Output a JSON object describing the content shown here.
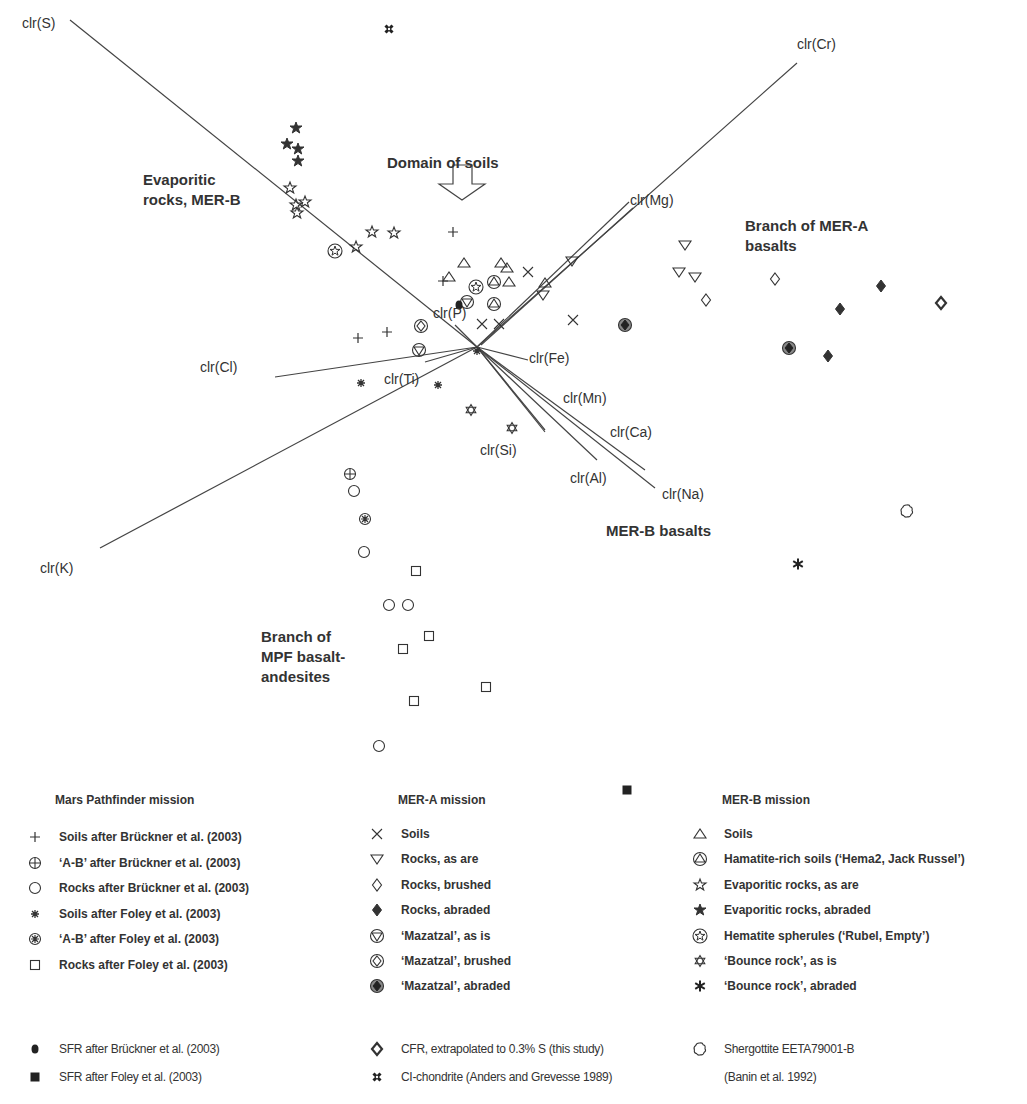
{
  "chart_data": {
    "type": "scatter",
    "subtype": "clr-biplot",
    "title": "",
    "xlabel": "",
    "ylabel": "",
    "grid": false,
    "origin_px": [
      477,
      347
    ],
    "axes_vectors": [
      {
        "label": "clr(S)",
        "end": [
          70,
          20
        ],
        "label_pos": [
          22,
          28
        ]
      },
      {
        "label": "clr(Cr)",
        "end": [
          797,
          63
        ],
        "label_pos": [
          797,
          49
        ]
      },
      {
        "label": "clr(Mg)",
        "end": [
          629,
          202
        ],
        "label_pos": [
          630,
          205
        ]
      },
      {
        "label": "clr(P)",
        "end": [
          455,
          325
        ],
        "label_pos": [
          433,
          318
        ]
      },
      {
        "label": "clr(Cl)",
        "end": [
          275,
          377
        ],
        "label_pos": [
          200,
          372
        ]
      },
      {
        "label": "clr(Ti)",
        "end": [
          425,
          362
        ],
        "label_pos": [
          384,
          384
        ]
      },
      {
        "label": "clr(K)",
        "end": [
          100,
          548
        ],
        "label_pos": [
          40,
          573
        ]
      },
      {
        "label": "clr(Fe)",
        "end": [
          528,
          360
        ],
        "label_pos": [
          529,
          363
        ]
      },
      {
        "label": "clr(Mn)",
        "end": [
          545,
          430
        ],
        "label_pos": [
          563,
          403
        ]
      },
      {
        "label": "clr(Si)",
        "end": [
          545,
          432
        ],
        "label_pos": [
          480,
          455
        ]
      },
      {
        "label": "clr(Al)",
        "end": [
          597,
          460
        ],
        "label_pos": [
          570,
          483
        ]
      },
      {
        "label": "clr(Ca)",
        "end": [
          645,
          470
        ],
        "label_pos": [
          610,
          437
        ]
      },
      {
        "label": "clr(Na)",
        "end": [
          655,
          488
        ],
        "label_pos": [
          662,
          499
        ]
      }
    ],
    "annotations": [
      {
        "text": "Domain of soils",
        "pos": [
          388,
          167
        ],
        "arrow": "down"
      },
      {
        "text": "Evaporitic rocks, MER-B",
        "pos": [
          143,
          184
        ]
      },
      {
        "text": "Branch of MER-A basalts",
        "pos": [
          745,
          230
        ]
      },
      {
        "text": "MER-B basalts",
        "pos": [
          606,
          535
        ]
      },
      {
        "text": "Branch of MPF basalt-andesites",
        "pos": [
          260,
          641
        ]
      }
    ],
    "series": [
      {
        "name": "MPF Soils after Brückner et al. (2003)",
        "marker": "plus",
        "points": [
          [
            453,
            232
          ],
          [
            443,
            281
          ],
          [
            358,
            338
          ],
          [
            387,
            332
          ]
        ]
      },
      {
        "name": "MPF 'A-B' after Brückner et al. (2003)",
        "marker": "circle-plus",
        "points": [
          [
            350,
            474
          ]
        ]
      },
      {
        "name": "MPF Rocks after Brückner et al. (2003)",
        "marker": "circle",
        "points": [
          [
            354,
            491
          ],
          [
            364,
            552
          ],
          [
            389,
            605
          ],
          [
            408,
            605
          ],
          [
            379,
            746
          ]
        ]
      },
      {
        "name": "MPF Soils after Foley et al. (2003)",
        "marker": "asterisk",
        "points": [
          [
            361,
            383
          ],
          [
            438,
            385
          ],
          [
            477,
            351
          ]
        ]
      },
      {
        "name": "MPF 'A-B' after Foley et al. (2003)",
        "marker": "circle-asterisk",
        "points": [
          [
            365,
            519
          ]
        ]
      },
      {
        "name": "MPF Rocks after Foley et al. (2003)",
        "marker": "square",
        "points": [
          [
            416,
            571
          ],
          [
            429,
            636
          ],
          [
            403,
            649
          ],
          [
            486,
            687
          ],
          [
            414,
            701
          ]
        ]
      },
      {
        "name": "MER-A Soils",
        "marker": "x",
        "points": [
          [
            528,
            272
          ],
          [
            482,
            324
          ],
          [
            499,
            324
          ],
          [
            573,
            320
          ]
        ]
      },
      {
        "name": "MER-A Rocks, as are",
        "marker": "triangle-down",
        "points": [
          [
            572,
            261
          ],
          [
            543,
            295
          ],
          [
            685,
            245
          ],
          [
            679,
            272
          ],
          [
            695,
            277
          ]
        ]
      },
      {
        "name": "MER-A Rocks, brushed",
        "marker": "diamond",
        "points": [
          [
            706,
            300
          ],
          [
            775,
            279
          ]
        ]
      },
      {
        "name": "MER-A Rocks, abraded",
        "marker": "diamond-filled",
        "points": [
          [
            881,
            286
          ],
          [
            840,
            309
          ],
          [
            828,
            356
          ]
        ]
      },
      {
        "name": "MER-A 'Mazatzal', as is",
        "marker": "circle-triangle-down",
        "points": [
          [
            419,
            350
          ],
          [
            467,
            302
          ]
        ]
      },
      {
        "name": "MER-A 'Mazatzal', brushed",
        "marker": "circle-diamond",
        "points": [
          [
            421,
            326
          ]
        ]
      },
      {
        "name": "MER-A 'Mazatzal', abraded",
        "marker": "circle-diamond-filled",
        "points": [
          [
            625,
            325
          ],
          [
            789,
            348
          ]
        ]
      },
      {
        "name": "MER-B Soils",
        "marker": "triangle",
        "points": [
          [
            464,
            263
          ],
          [
            501,
            263
          ],
          [
            449,
            277
          ],
          [
            507,
            268
          ],
          [
            509,
            282
          ],
          [
            545,
            283
          ]
        ]
      },
      {
        "name": "MER-B Hamatite-rich soils ('Hema2, Jack Russel')",
        "marker": "circle-triangle",
        "points": [
          [
            494,
            282
          ],
          [
            494,
            304
          ]
        ]
      },
      {
        "name": "MER-B Evaporitic rocks, as are",
        "marker": "star-open",
        "points": [
          [
            290,
            188
          ],
          [
            305,
            202
          ],
          [
            296,
            205
          ],
          [
            297,
            213
          ],
          [
            356,
            247
          ],
          [
            372,
            232
          ],
          [
            394,
            233
          ]
        ]
      },
      {
        "name": "MER-B Evaporitic rocks, abraded",
        "marker": "star-filled",
        "points": [
          [
            296,
            128
          ],
          [
            287,
            144
          ],
          [
            298,
            149
          ],
          [
            298,
            161
          ]
        ]
      },
      {
        "name": "MER-B Hematite spherules ('Rubel, Empty')",
        "marker": "circle-star",
        "points": [
          [
            335,
            251
          ],
          [
            476,
            287
          ]
        ]
      },
      {
        "name": "MER-B 'Bounce rock', as is",
        "marker": "hexagram",
        "points": [
          [
            471,
            410
          ],
          [
            512,
            428
          ]
        ]
      },
      {
        "name": "MER-B 'Bounce rock', abraded",
        "marker": "asterisk-bold",
        "points": [
          [
            798,
            564
          ]
        ]
      },
      {
        "name": "SFR after Brückner et al. (2003)",
        "marker": "dot-filled",
        "points": [
          [
            459,
            305
          ]
        ]
      },
      {
        "name": "SFR after Foley et al. (2003)",
        "marker": "square-filled",
        "points": [
          [
            627,
            790
          ]
        ]
      },
      {
        "name": "CFR, extrapolated to 0.3% S (this study)",
        "marker": "diamond-bold",
        "points": [
          [
            941,
            303
          ]
        ]
      },
      {
        "name": "CI-chondrite (Anders and Grevesse 1989)",
        "marker": "chondrite-cross",
        "points": [
          [
            389,
            29
          ]
        ]
      },
      {
        "name": "Shergottite EETA79001-B (Banin et al. 1992)",
        "marker": "flower",
        "points": [
          [
            907,
            511
          ]
        ]
      }
    ]
  },
  "labels": {
    "axes": [
      "clr(S)",
      "clr(Cr)",
      "clr(Mg)",
      "clr(P)",
      "clr(Cl)",
      "clr(Ti)",
      "clr(K)",
      "clr(Fe)",
      "clr(Mn)",
      "clr(Si)",
      "clr(Al)",
      "clr(Ca)",
      "clr(Na)"
    ],
    "domain_of_soils": "Domain of soils",
    "evaporitic_1": "Evaporitic",
    "evaporitic_2": "rocks, MER-B",
    "mera_branch_1": "Branch of MER-A",
    "mera_branch_2": "basalts",
    "merb_basalts": "MER-B basalts",
    "mpf_branch_1": "Branch of",
    "mpf_branch_2": "MPF basalt-",
    "mpf_branch_3": "andesites"
  },
  "legend": {
    "mpf": {
      "title": "Mars Pathfinder mission",
      "items": [
        {
          "marker": "plus",
          "label": "Soils after Brückner et al. (2003)"
        },
        {
          "marker": "circle-plus",
          "label": "‘A-B’ after Brückner et al. (2003)"
        },
        {
          "marker": "circle",
          "label": "Rocks after Brückner et al. (2003)"
        },
        {
          "marker": "asterisk",
          "label": "Soils after Foley et al. (2003)"
        },
        {
          "marker": "circle-asterisk",
          "label": "‘A-B’ after Foley et al. (2003)"
        },
        {
          "marker": "square",
          "label": "Rocks after Foley et al. (2003)"
        }
      ]
    },
    "mera": {
      "title": "MER-A mission",
      "items": [
        {
          "marker": "x",
          "label": "Soils"
        },
        {
          "marker": "triangle-down",
          "label": "Rocks, as are"
        },
        {
          "marker": "diamond",
          "label": "Rocks, brushed"
        },
        {
          "marker": "diamond-filled",
          "label": "Rocks, abraded"
        },
        {
          "marker": "circle-triangle-down",
          "label": "‘Mazatzal’, as is"
        },
        {
          "marker": "circle-diamond",
          "label": "‘Mazatzal’, brushed"
        },
        {
          "marker": "circle-diamond-filled",
          "label": "‘Mazatzal’, abraded"
        }
      ]
    },
    "merb": {
      "title": "MER-B mission",
      "items": [
        {
          "marker": "triangle",
          "label": "Soils"
        },
        {
          "marker": "circle-triangle",
          "label": "Hamatite-rich soils (‘Hema2, Jack Russel’)"
        },
        {
          "marker": "star-open",
          "label": "Evaporitic rocks, as are"
        },
        {
          "marker": "star-filled",
          "label": "Evaporitic rocks, abraded"
        },
        {
          "marker": "circle-star",
          "label": "Hematite spherules (‘Rubel, Empty’)"
        },
        {
          "marker": "hexagram",
          "label": "‘Bounce rock’, as is"
        },
        {
          "marker": "asterisk-bold",
          "label": "‘Bounce rock’, abraded"
        }
      ]
    },
    "references": [
      {
        "marker": "dot-filled",
        "label": "SFR after Brückner et al. (2003)"
      },
      {
        "marker": "square-filled",
        "label": "SFR after Foley et al. (2003)"
      },
      {
        "marker": "diamond-bold",
        "label": "CFR, extrapolated to 0.3% S (this study)"
      },
      {
        "marker": "chondrite-cross",
        "label": "CI-chondrite (Anders and Grevesse 1989)"
      },
      {
        "marker": "flower",
        "label": "Shergottite EETA79001-B"
      },
      {
        "marker": "none",
        "label": "(Banin et al. 1992)"
      }
    ]
  },
  "colors": {
    "ink": "#333333",
    "line": "#444444",
    "background": "#ffffff"
  }
}
